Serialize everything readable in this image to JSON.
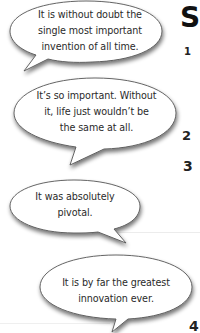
{
  "heading": {
    "letter": "S"
  },
  "bubbles": [
    {
      "lines": [
        "It is without doubt the",
        "single most important",
        "invention of all time."
      ]
    },
    {
      "lines": [
        "It’s so important. Without",
        "it, life just wouldn’t be",
        "the same at all."
      ]
    },
    {
      "lines": [
        "It was absolutely",
        "pivotal."
      ]
    },
    {
      "lines": [
        "It is by far the greatest",
        "innovation ever."
      ]
    }
  ],
  "numbers": [
    "1",
    "2",
    "3",
    "4"
  ]
}
